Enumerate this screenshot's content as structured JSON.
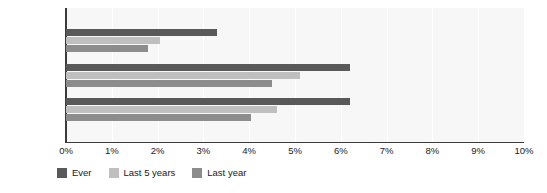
{
  "chart_data": {
    "type": "bar",
    "orientation": "horizontal",
    "title": "",
    "xlabel": "",
    "ylabel": "",
    "categories": [
      "Outside city",
      "Other city",
      "Dublin"
    ],
    "series": [
      {
        "name": "Ever",
        "color": "#595959",
        "values": [
          3.3,
          6.2,
          6.2
        ]
      },
      {
        "name": "Last 5 years",
        "color": "#bfbfbf",
        "values": [
          2.05,
          5.1,
          4.6
        ]
      },
      {
        "name": "Last year",
        "color": "#8c8c8c",
        "values": [
          1.8,
          4.5,
          4.05
        ]
      }
    ],
    "xlim": [
      0,
      10
    ],
    "xticks": [
      0,
      1,
      2,
      3,
      4,
      5,
      6,
      7,
      8,
      9,
      10
    ],
    "xtick_labels": [
      "0%",
      "1%",
      "2%",
      "3%",
      "4%",
      "5%",
      "6%",
      "7%",
      "8%",
      "9%",
      "10%"
    ],
    "grid": true,
    "grid_axis": "x",
    "legend_position": "bottom-left",
    "plot_background": "#f7f7f7",
    "gridline_color": "#ffffff",
    "axis_color": "#3b3b3b"
  }
}
